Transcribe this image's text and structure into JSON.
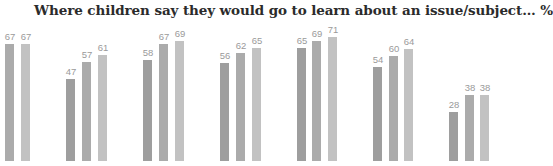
{
  "chart_data": {
    "type": "bar",
    "title": "Where children say they would go to learn about an issue/subject…  %",
    "xlabel": "",
    "ylabel": "%",
    "ylim": [
      0,
      90
    ],
    "grid": false,
    "legend": "none visible",
    "categories": [
      "Group 1",
      "Group 2",
      "Group 3",
      "Group 4",
      "Group 5",
      "Group 6",
      "Group 7"
    ],
    "series": [
      {
        "name": "Series 1",
        "color": "#9e9e9e",
        "values": [
          null,
          47,
          58,
          56,
          65,
          54,
          28
        ]
      },
      {
        "name": "Series 2",
        "color": "#ababab",
        "values": [
          67,
          57,
          67,
          62,
          69,
          60,
          38
        ]
      },
      {
        "name": "Series 3",
        "color": "#c2c2c2",
        "values": [
          67,
          61,
          69,
          65,
          71,
          64,
          38
        ]
      }
    ]
  },
  "bars": [
    {
      "x": 5,
      "value": 67,
      "label": "67",
      "color": "#ababab"
    },
    {
      "x": 21,
      "value": 67,
      "label": "67",
      "color": "#c2c2c2"
    },
    {
      "x": 66,
      "value": 47,
      "label": "47",
      "color": "#9e9e9e"
    },
    {
      "x": 82,
      "value": 57,
      "label": "57",
      "color": "#ababab"
    },
    {
      "x": 98,
      "value": 61,
      "label": "61",
      "color": "#c2c2c2"
    },
    {
      "x": 143,
      "value": 58,
      "label": "58",
      "color": "#9e9e9e"
    },
    {
      "x": 159,
      "value": 67,
      "label": "67",
      "color": "#ababab"
    },
    {
      "x": 175,
      "value": 69,
      "label": "69",
      "color": "#c2c2c2"
    },
    {
      "x": 220,
      "value": 56,
      "label": "56",
      "color": "#9e9e9e"
    },
    {
      "x": 236,
      "value": 62,
      "label": "62",
      "color": "#ababab"
    },
    {
      "x": 252,
      "value": 65,
      "label": "65",
      "color": "#c2c2c2"
    },
    {
      "x": 297,
      "value": 65,
      "label": "65",
      "color": "#9e9e9e"
    },
    {
      "x": 312,
      "value": 69,
      "label": "69",
      "color": "#ababab"
    },
    {
      "x": 328,
      "value": 71,
      "label": "71",
      "color": "#c2c2c2"
    },
    {
      "x": 373,
      "value": 54,
      "label": "54",
      "color": "#9e9e9e"
    },
    {
      "x": 389,
      "value": 60,
      "label": "60",
      "color": "#ababab"
    },
    {
      "x": 404,
      "value": 64,
      "label": "64",
      "color": "#c2c2c2"
    },
    {
      "x": 449,
      "value": 28,
      "label": "28",
      "color": "#9e9e9e"
    },
    {
      "x": 465,
      "value": 38,
      "label": "38",
      "color": "#ababab"
    },
    {
      "x": 480,
      "value": 38,
      "label": "38",
      "color": "#c2c2c2"
    }
  ],
  "layout": {
    "baseline_y": 161,
    "px_per_unit": 1.745
  }
}
